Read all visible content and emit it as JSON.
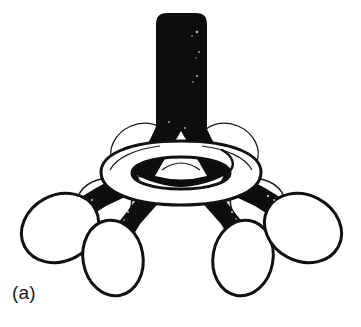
{
  "figure": {
    "panel_label": "(a)",
    "title": "",
    "caption": "",
    "style": "black-and-white line drawing",
    "background_color": "#ffffff",
    "ink_color": "#0d0d0d",
    "fill_color": "#ffffff",
    "outline_color": "#111111"
  },
  "parts": {
    "stem": {
      "name": "central-stem",
      "description": "solid black vertical cylinder",
      "fill": "#0d0d0d"
    },
    "collar": {
      "name": "torus-collar",
      "description": "white ring with black outline encircling base of stem",
      "fill": "#ffffff",
      "stroke": "#111111"
    },
    "inner_triangle": {
      "name": "inner-white-triangle",
      "description": "white triangular gap visible inside the collar under the stem",
      "fill": "#ffffff"
    },
    "arms": [
      {
        "name": "arm-far-left",
        "angle_deg": 208
      },
      {
        "name": "arm-left-front",
        "angle_deg": 248
      },
      {
        "name": "arm-right-front",
        "angle_deg": 292
      },
      {
        "name": "arm-far-right",
        "angle_deg": 332
      }
    ],
    "bulbs": [
      {
        "name": "bulb-far-left",
        "cx": 60,
        "cy": 228,
        "rx": 40,
        "ry": 33,
        "rotation_deg": -28
      },
      {
        "name": "bulb-left-front",
        "cx": 113,
        "cy": 258,
        "rx": 30,
        "ry": 38,
        "rotation_deg": -10
      },
      {
        "name": "bulb-right-front",
        "cx": 243,
        "cy": 258,
        "rx": 30,
        "ry": 38,
        "rotation_deg": 10
      },
      {
        "name": "bulb-far-right",
        "cx": 303,
        "cy": 228,
        "rx": 40,
        "ry": 33,
        "rotation_deg": 28
      }
    ],
    "hidden_bulbs": [
      {
        "name": "hidden-bulb-left",
        "description": "partially occluded outline behind left arms"
      },
      {
        "name": "hidden-bulb-right",
        "description": "partially occluded outline behind right arms"
      },
      {
        "name": "hidden-bulb-back-left",
        "description": "faint outline behind collar, upper left"
      },
      {
        "name": "hidden-bulb-back-right",
        "description": "faint outline behind collar, upper right"
      }
    ]
  }
}
